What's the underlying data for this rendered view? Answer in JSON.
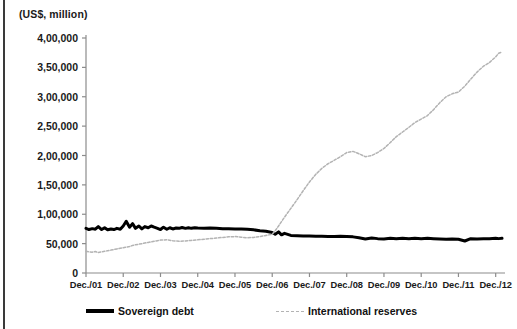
{
  "figure": {
    "axis_unit_label": "(US$, million)",
    "background": "#ffffff",
    "border_color": "#3a3a3a"
  },
  "legend": {
    "position": "bottom",
    "entries": [
      {
        "label": "Sovereign debt",
        "style": "solid",
        "color": "#000000",
        "width": 3.4
      },
      {
        "label": "International  reserves",
        "style": "dashed",
        "color": "#b3b3b3",
        "width": 1.6
      }
    ]
  },
  "chart_data": {
    "type": "line",
    "title": "",
    "subtitle": "",
    "xlabel": "",
    "ylabel": "(US$, million)",
    "grid": false,
    "legend_position": "bottom",
    "ylim": [
      0,
      400000
    ],
    "ytick_labels": [
      "0",
      "50,000",
      "1,00,000",
      "1,50,000",
      "2,00,000",
      "2,50,000",
      "3,00,000",
      "3,50,000",
      "4,00,000"
    ],
    "ytick_values": [
      0,
      50000,
      100000,
      150000,
      200000,
      250000,
      300000,
      350000,
      400000
    ],
    "xtick_labels": [
      "Dec./01",
      "Dec./02",
      "Dec./03",
      "Dec./04",
      "Dec./05",
      "Dec./06",
      "Dec./07",
      "Dec./08",
      "Dec./09",
      "Dec./10",
      "Dec./11",
      "Dec./12"
    ],
    "xtick_values": [
      2001,
      2002,
      2003,
      2004,
      2005,
      2006,
      2007,
      2008,
      2009,
      2010,
      2011,
      2012
    ],
    "xlim": [
      2001,
      2012.25
    ],
    "series": [
      {
        "name": "Sovereign debt",
        "style": "solid",
        "color": "#000000",
        "x": [
          2001.0,
          2001.08,
          2001.17,
          2001.25,
          2001.33,
          2001.42,
          2001.5,
          2001.58,
          2001.67,
          2001.75,
          2001.83,
          2001.92,
          2002.0,
          2002.08,
          2002.17,
          2002.25,
          2002.33,
          2002.42,
          2002.5,
          2002.58,
          2002.67,
          2002.75,
          2002.83,
          2002.92,
          2003.0,
          2003.08,
          2003.17,
          2003.25,
          2003.33,
          2003.42,
          2003.5,
          2003.58,
          2003.67,
          2003.75,
          2003.83,
          2003.92,
          2004.0,
          2004.17,
          2004.33,
          2004.5,
          2004.67,
          2004.83,
          2005.0,
          2005.17,
          2005.33,
          2005.5,
          2005.67,
          2005.83,
          2006.0,
          2006.08,
          2006.17,
          2006.25,
          2006.33,
          2006.5,
          2006.67,
          2006.83,
          2007.0,
          2007.17,
          2007.33,
          2007.5,
          2007.67,
          2007.83,
          2008.0,
          2008.17,
          2008.33,
          2008.5,
          2008.67,
          2008.83,
          2009.0,
          2009.17,
          2009.33,
          2009.5,
          2009.67,
          2009.83,
          2010.0,
          2010.17,
          2010.33,
          2010.5,
          2010.67,
          2010.83,
          2011.0,
          2011.17,
          2011.33,
          2011.5,
          2011.67,
          2011.83,
          2012.0,
          2012.08,
          2012.17
        ],
        "values": [
          76000,
          74000,
          75500,
          74500,
          79000,
          74000,
          77000,
          73500,
          75000,
          74000,
          76000,
          74500,
          80000,
          88000,
          78000,
          84000,
          76000,
          80000,
          75000,
          79000,
          77000,
          80000,
          78000,
          76000,
          74000,
          78000,
          74500,
          77000,
          75000,
          76500,
          76000,
          77500,
          76000,
          77000,
          76000,
          77000,
          76500,
          76000,
          76500,
          76000,
          75500,
          75500,
          75000,
          75000,
          74500,
          73500,
          72000,
          71000,
          69000,
          66000,
          70000,
          65000,
          67500,
          64000,
          63500,
          63000,
          63000,
          62500,
          62500,
          62000,
          62000,
          62500,
          62000,
          61500,
          60000,
          58000,
          59500,
          58500,
          58000,
          59000,
          58500,
          59000,
          58500,
          59000,
          58500,
          59000,
          58500,
          58000,
          57500,
          58000,
          57500,
          54500,
          58500,
          58000,
          58500,
          58500,
          59000,
          58500,
          59000
        ]
      },
      {
        "name": "International reserves",
        "style": "dashed",
        "color": "#b3b3b3",
        "x": [
          2001.0,
          2001.08,
          2001.17,
          2001.25,
          2001.33,
          2001.42,
          2001.5,
          2001.58,
          2001.67,
          2001.75,
          2001.83,
          2001.92,
          2002.0,
          2002.08,
          2002.17,
          2002.25,
          2002.33,
          2002.42,
          2002.5,
          2002.58,
          2002.67,
          2002.75,
          2002.83,
          2002.92,
          2003.0,
          2003.17,
          2003.33,
          2003.5,
          2003.67,
          2003.83,
          2004.0,
          2004.17,
          2004.33,
          2004.5,
          2004.67,
          2004.83,
          2005.0,
          2005.17,
          2005.33,
          2005.5,
          2005.67,
          2005.83,
          2006.0,
          2006.08,
          2006.17,
          2006.33,
          2006.5,
          2006.67,
          2006.83,
          2007.0,
          2007.17,
          2007.33,
          2007.5,
          2007.67,
          2007.83,
          2008.0,
          2008.17,
          2008.33,
          2008.5,
          2008.67,
          2008.83,
          2009.0,
          2009.17,
          2009.33,
          2009.5,
          2009.67,
          2009.83,
          2010.0,
          2010.17,
          2010.33,
          2010.5,
          2010.67,
          2010.83,
          2011.0,
          2011.17,
          2011.33,
          2011.5,
          2011.67,
          2011.83,
          2012.0,
          2012.08,
          2012.17
        ],
        "values": [
          37000,
          36000,
          35500,
          36500,
          35000,
          36000,
          37000,
          38000,
          39000,
          40000,
          41000,
          42000,
          43000,
          44000,
          45000,
          47000,
          48000,
          49000,
          50000,
          51000,
          52000,
          53000,
          54000,
          55000,
          56000,
          56500,
          55000,
          54000,
          54500,
          55500,
          56500,
          57500,
          58500,
          59500,
          60500,
          61500,
          62000,
          61000,
          60000,
          60500,
          62000,
          64000,
          66000,
          72000,
          80000,
          95000,
          110000,
          125000,
          140000,
          155000,
          168000,
          178000,
          186000,
          192000,
          198000,
          205000,
          207000,
          203000,
          198000,
          200000,
          205000,
          212000,
          222000,
          232000,
          240000,
          248000,
          256000,
          262000,
          268000,
          278000,
          290000,
          300000,
          305000,
          308000,
          318000,
          330000,
          342000,
          352000,
          358000,
          368000,
          374000,
          376000
        ]
      }
    ]
  }
}
